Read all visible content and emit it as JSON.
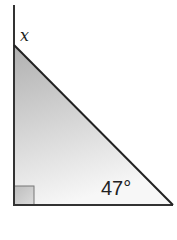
{
  "diagram": {
    "type": "right-triangle",
    "labels": {
      "unknown_angle": "x",
      "known_angle": "47°"
    },
    "right_angle_marker": true,
    "colors": {
      "line": "#333333",
      "fill_top": "#b0b0b0",
      "fill_bottom": "#f7f7f7",
      "marker_fill": "#c8c8c8"
    }
  }
}
